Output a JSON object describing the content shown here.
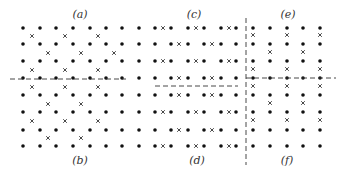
{
  "figure": {
    "labels": [
      {
        "id": "a",
        "text": "(a)",
        "x": 80,
        "y": 18
      },
      {
        "id": "b",
        "text": "(b)",
        "x": 80,
        "y": 164
      },
      {
        "id": "c",
        "text": "(c)",
        "x": 194,
        "y": 18
      },
      {
        "id": "d",
        "text": "(d)",
        "x": 197,
        "y": 164
      },
      {
        "id": "e",
        "text": "(e)",
        "x": 288,
        "y": 18
      },
      {
        "id": "f",
        "text": "(f)",
        "x": 287,
        "y": 164
      }
    ],
    "colors": {
      "dot": "#111111",
      "cross": "#333333",
      "dash": "#333333"
    },
    "rows_y": [
      28,
      44,
      61,
      78,
      95,
      112,
      130,
      146
    ],
    "left_panel": {
      "dot_columns_x": [
        23,
        40,
        56,
        73,
        90,
        106,
        122,
        139
      ],
      "crosses": [
        {
          "y": 36,
          "x": [
            32,
            65,
            98
          ]
        },
        {
          "y": 53,
          "x": [
            48,
            81,
            114
          ]
        },
        {
          "y": 70,
          "x": [
            32,
            65,
            98
          ]
        },
        {
          "y": 87,
          "x": [
            32,
            65,
            98
          ]
        },
        {
          "y": 104,
          "x": [
            48,
            81
          ]
        },
        {
          "y": 121,
          "x": [
            32,
            65,
            98
          ]
        },
        {
          "y": 138,
          "x": [
            48,
            81
          ]
        }
      ],
      "dashed_line": {
        "x1": 10,
        "x2": 126,
        "y1": 79,
        "y2": 79
      }
    },
    "middle_panel": {
      "row_types": [
        "A",
        "B",
        "A",
        "B",
        "B",
        "A",
        "B",
        "A"
      ],
      "type_A": {
        "dots_x": [
          155,
          171,
          188,
          204,
          221,
          236
        ],
        "crosses_x": [
          163,
          196,
          229
        ]
      },
      "type_B": {
        "dots_x": [
          155,
          171,
          188,
          204,
          221,
          236
        ],
        "crosses_x": [
          179,
          212
        ]
      },
      "dashed_line": {
        "x1": 155,
        "x2": 238,
        "y1": 86,
        "y2": 86
      }
    },
    "right_panel": {
      "dot_columns_x": [
        253,
        270,
        287,
        303,
        320
      ],
      "crosses": [
        {
          "y": 35,
          "x": [
            253,
            287,
            320
          ]
        },
        {
          "y": 52,
          "x": [
            270,
            303
          ]
        },
        {
          "y": 69,
          "x": [
            253,
            287,
            320
          ]
        },
        {
          "y": 86,
          "x": [
            253,
            287,
            320
          ]
        },
        {
          "y": 103,
          "x": [
            270,
            303
          ]
        },
        {
          "y": 120,
          "x": [
            253,
            287,
            320
          ]
        }
      ],
      "dashed_line": {
        "x1": 246,
        "x2": 336,
        "y1": 78,
        "y2": 78
      },
      "vertical_dashed_line": {
        "x1": 246,
        "x2": 246,
        "y1": 18,
        "y2": 165
      }
    }
  }
}
